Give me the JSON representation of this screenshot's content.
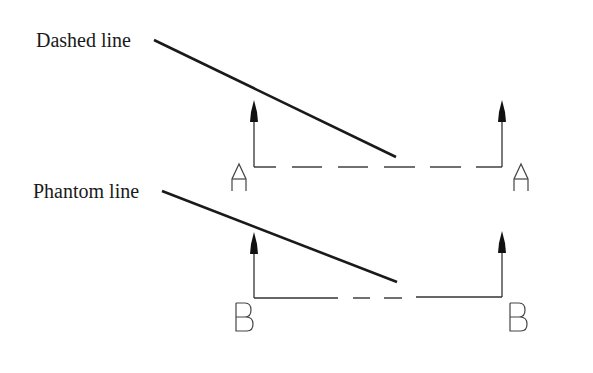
{
  "diagram": {
    "labels": {
      "dashed": "Dashed line",
      "phantom": "Phantom line"
    },
    "section_letters": {
      "top_left": "A",
      "top_right": "A",
      "bottom_left": "B",
      "bottom_right": "B"
    },
    "colors": {
      "ink": "#1a1a1a",
      "thin_line": "#333333",
      "background": "#ffffff"
    }
  }
}
